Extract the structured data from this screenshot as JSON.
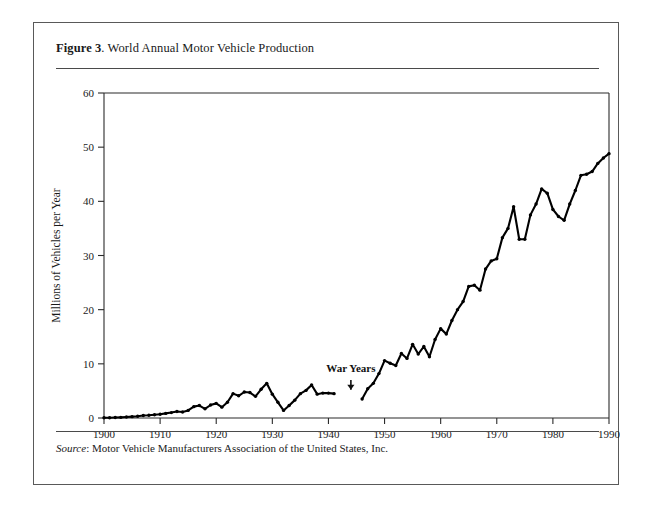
{
  "figure": {
    "label": "Figure 3",
    "title": ". World Annual Motor Vehicle Production",
    "source_label": "Source",
    "source_text": ": Motor Vehicle Manufacturers Association of the United States, Inc."
  },
  "chart_data": {
    "type": "line",
    "title": "World Annual Motor Vehicle Production",
    "xlabel": "",
    "ylabel": "Millions of Vehicles per Year",
    "xlim": [
      1900,
      1990
    ],
    "ylim": [
      0,
      60
    ],
    "xticks": [
      1900,
      1910,
      1920,
      1930,
      1940,
      1950,
      1960,
      1970,
      1980,
      1990
    ],
    "yticks": [
      0,
      10,
      20,
      30,
      40,
      50,
      60
    ],
    "grid": false,
    "legend": "none",
    "annotations": [
      {
        "text": "War Years",
        "x": 1944,
        "y": 8.5,
        "arrow_to_y": 4.5
      }
    ],
    "series": [
      {
        "name": "World annual motor vehicle production",
        "gap_years": [
          1942,
          1943,
          1944,
          1945
        ],
        "x": [
          1900,
          1901,
          1902,
          1903,
          1904,
          1905,
          1906,
          1907,
          1908,
          1909,
          1910,
          1911,
          1912,
          1913,
          1914,
          1915,
          1916,
          1917,
          1918,
          1919,
          1920,
          1921,
          1922,
          1923,
          1924,
          1925,
          1926,
          1927,
          1928,
          1929,
          1930,
          1931,
          1932,
          1933,
          1934,
          1935,
          1936,
          1937,
          1938,
          1939,
          1940,
          1941,
          1946,
          1947,
          1948,
          1949,
          1950,
          1951,
          1952,
          1953,
          1954,
          1955,
          1956,
          1957,
          1958,
          1959,
          1960,
          1961,
          1962,
          1963,
          1964,
          1965,
          1966,
          1967,
          1968,
          1969,
          1970,
          1971,
          1972,
          1973,
          1974,
          1975,
          1976,
          1977,
          1978,
          1979,
          1980,
          1981,
          1982,
          1983,
          1984,
          1985,
          1986,
          1987,
          1988,
          1989,
          1990
        ],
        "values": [
          0.05,
          0.06,
          0.08,
          0.12,
          0.18,
          0.25,
          0.33,
          0.45,
          0.5,
          0.6,
          0.7,
          0.85,
          1.0,
          1.2,
          1.1,
          1.4,
          2.1,
          2.3,
          1.7,
          2.4,
          2.7,
          2.0,
          2.9,
          4.5,
          4.1,
          4.8,
          4.7,
          4.0,
          5.3,
          6.4,
          4.4,
          2.9,
          1.4,
          2.3,
          3.3,
          4.5,
          5.1,
          6.1,
          4.4,
          4.6,
          4.6,
          4.5,
          3.5,
          5.4,
          6.4,
          8.2,
          10.6,
          10.1,
          9.7,
          11.9,
          11.0,
          13.6,
          11.8,
          13.2,
          11.3,
          14.5,
          16.5,
          15.5,
          18.0,
          20.0,
          21.5,
          24.3,
          24.5,
          23.6,
          27.5,
          29.0,
          29.4,
          33.3,
          35.0,
          39.0,
          33.0,
          33.0,
          37.5,
          39.5,
          42.3,
          41.5,
          38.5,
          37.2,
          36.5,
          39.5,
          42.0,
          44.8,
          45.0,
          45.5,
          47.0,
          48.0,
          48.8
        ]
      }
    ]
  }
}
